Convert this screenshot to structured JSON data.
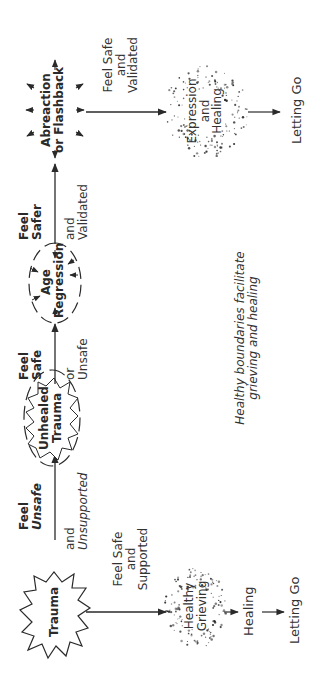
{
  "diagram": {
    "top_path": {
      "nodes": {
        "trauma": "Trauma",
        "unhealed_trauma": [
          "Unhealed",
          "Trauma"
        ],
        "age_regression": [
          "Age",
          "Regression"
        ],
        "abreaction": [
          "Abreaction",
          "or Flashback"
        ],
        "expression_healing": [
          "Expression",
          "and",
          "Healing"
        ],
        "letting_go": "Letting Go"
      },
      "edges": {
        "trauma_to_unhealed": {
          "above": [
            "Feel",
            "Unsafe"
          ],
          "below": [
            "and",
            "Unsupported"
          ]
        },
        "unhealed_to_age": {
          "above": [
            "Feel",
            "Safe"
          ],
          "below": [
            "or",
            "Unsafe"
          ]
        },
        "age_to_abreaction": {
          "above": [
            "Feel",
            "Safer"
          ],
          "below": [
            "and",
            "Validated"
          ]
        },
        "abreaction_to_expression": {
          "side": [
            "Feel Safe",
            "and",
            "Validated"
          ]
        }
      }
    },
    "bottom_path": {
      "nodes": {
        "healthy_grieving": [
          "Healthy",
          "Grieving"
        ],
        "healing": "Healing",
        "letting_go": "Letting Go"
      },
      "edges": {
        "trauma_to_grieving": {
          "side": [
            "Feel Safe",
            "and",
            "Supported"
          ]
        }
      }
    },
    "caption": [
      "Healthy boundaries facilitate",
      "grieving and healing"
    ],
    "colors": {
      "ink": "#2a2a2a",
      "background": "#ffffff"
    }
  }
}
